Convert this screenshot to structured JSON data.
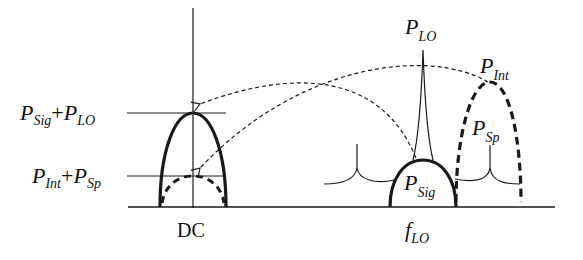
{
  "diagram": {
    "type": "frequency-spectrum-downconversion",
    "left_axis": {
      "label": "DC",
      "levels": [
        {
          "main": "P",
          "sub": "Sig",
          "plus": "+",
          "main2": "P",
          "sub2": "LO"
        },
        {
          "main": "P",
          "sub": "Int",
          "plus": "+",
          "main2": "P",
          "sub2": "Sp"
        }
      ]
    },
    "right_spectrum": {
      "axis_label": {
        "main": "f",
        "sub": "LO"
      },
      "components": [
        {
          "main": "P",
          "sub": "LO",
          "style": "thin-spike"
        },
        {
          "main": "P",
          "sub": "Int",
          "style": "thick-dashed-arch"
        },
        {
          "main": "P",
          "sub": "Sp",
          "style": "thin-spurs"
        },
        {
          "main": "P",
          "sub": "Sig",
          "style": "thick-solid-arch"
        }
      ]
    },
    "arrows": [
      {
        "from": "P_LO / P_Sig",
        "to": "P_Sig+P_LO level",
        "style": "dashed"
      },
      {
        "from": "P_Int",
        "to": "P_Int+P_Sp level",
        "style": "dashed"
      }
    ],
    "colors": {
      "ink": "#1a1a1a",
      "background": "#ffffff"
    }
  }
}
